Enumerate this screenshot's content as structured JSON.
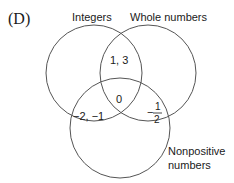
{
  "option_label": "(D)",
  "sets": [
    {
      "name": "Integers",
      "label": "Integers"
    },
    {
      "name": "Whole numbers",
      "label": "Whole numbers"
    },
    {
      "name": "Nonpositive numbers",
      "label_line1": "Nonpositive",
      "label_line2": "numbers"
    }
  ],
  "regions": {
    "integers_and_whole_only": "1, 3",
    "all_three": "0",
    "integers_and_nonpositive_only": "−2, −1",
    "whole_and_nonpositive_only": {
      "sign": "−",
      "numerator": "1",
      "denominator": "2"
    }
  },
  "colors": {
    "stroke": "#555555",
    "text": "#1a1a1a",
    "background": "#ffffff"
  }
}
